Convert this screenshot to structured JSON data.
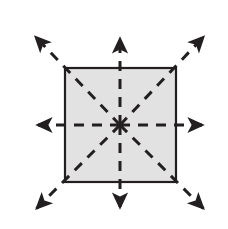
{
  "figure": {
    "canvas": {
      "width": 228,
      "height": 229,
      "background": "#ffffff"
    }
  },
  "chart_data": {
    "type": "diagram",
    "center": {
      "x": 120,
      "y": 125
    },
    "shape": {
      "name": "square",
      "left": 65,
      "top": 68,
      "right": 176,
      "bottom": 182,
      "width": 111,
      "height": 114,
      "fill": "#e2e2e2",
      "stroke": "#231f20",
      "stroke_width": 2.2
    },
    "arrows": [
      {
        "name": "arrow-up",
        "direction": "up",
        "angle_deg": 90,
        "from": {
          "x": 120,
          "y": 125
        },
        "to": {
          "x": 120,
          "y": 29
        }
      },
      {
        "name": "arrow-down",
        "direction": "down",
        "angle_deg": 270,
        "from": {
          "x": 120,
          "y": 125
        },
        "to": {
          "x": 120,
          "y": 217
        }
      },
      {
        "name": "arrow-left",
        "direction": "left",
        "angle_deg": 180,
        "from": {
          "x": 120,
          "y": 125
        },
        "to": {
          "x": 28,
          "y": 125
        }
      },
      {
        "name": "arrow-right",
        "direction": "right",
        "angle_deg": 0,
        "from": {
          "x": 120,
          "y": 125
        },
        "to": {
          "x": 212,
          "y": 125
        }
      },
      {
        "name": "arrow-up-left",
        "direction": "up-left",
        "angle_deg": 135,
        "from": {
          "x": 120,
          "y": 125
        },
        "to": {
          "x": 29,
          "y": 30
        }
      },
      {
        "name": "arrow-up-right",
        "direction": "up-right",
        "angle_deg": 45,
        "from": {
          "x": 120,
          "y": 125
        },
        "to": {
          "x": 210,
          "y": 30
        }
      },
      {
        "name": "arrow-down-left",
        "direction": "down-left",
        "angle_deg": 225,
        "from": {
          "x": 120,
          "y": 125
        },
        "to": {
          "x": 30,
          "y": 215
        }
      },
      {
        "name": "arrow-down-right",
        "direction": "down-right",
        "angle_deg": 315,
        "from": {
          "x": 120,
          "y": 125
        },
        "to": {
          "x": 210,
          "y": 215
        }
      }
    ],
    "line_style": {
      "stroke": "#231f20",
      "stroke_width": 3,
      "dash_array": "10 8",
      "arrowhead": "solid-triangle"
    },
    "colors": {
      "ink": "#231f20",
      "square_fill": "#e2e2e2",
      "background": "#ffffff"
    },
    "labels": [],
    "legend": null,
    "annotations": []
  }
}
